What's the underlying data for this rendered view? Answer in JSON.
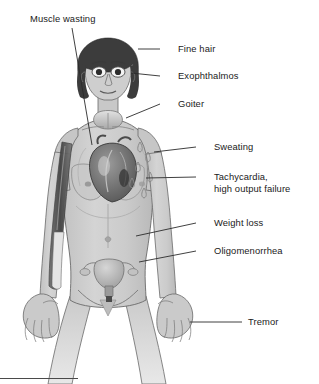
{
  "figure": {
    "background_color": "#ffffff",
    "body_fill": "#cfcfcf",
    "body_shade": "#b8b8b8",
    "outline_color": "#555555",
    "hair_color": "#3c3c3c",
    "organ_dark": "#5a5a5a",
    "organ_mid": "#8e8e8e",
    "organ_light": "#bdbdbd",
    "text_color": "#1a1a1a",
    "leader_color": "#2b2b2b"
  },
  "labels": [
    {
      "id": "muscle-wasting",
      "text": "Muscle wasting",
      "x": 30,
      "y": 13,
      "side": "left",
      "target": "upper arm muscle cutaway",
      "leader": {
        "x1": 72,
        "y1": 28,
        "x2": 92,
        "y2": 145
      }
    },
    {
      "id": "fine-hair",
      "text": "Fine hair",
      "x": 178,
      "y": 44,
      "side": "right",
      "target": "scalp hair",
      "leader": {
        "x1": 160,
        "y1": 49,
        "x2": 138,
        "y2": 49
      }
    },
    {
      "id": "exophthalmos",
      "text": "Exophthalmos",
      "x": 178,
      "y": 71,
      "side": "right",
      "target": "protruding eyes",
      "leader": {
        "x1": 160,
        "y1": 76,
        "x2": 131,
        "y2": 73
      }
    },
    {
      "id": "goiter",
      "text": "Goiter",
      "x": 178,
      "y": 99,
      "side": "right",
      "target": "enlarged thyroid gland at neck",
      "leader": {
        "x1": 160,
        "y1": 104,
        "x2": 126,
        "y2": 118
      }
    },
    {
      "id": "sweating",
      "text": "Sweating",
      "x": 214,
      "y": 142,
      "side": "right",
      "target": "sweat droplets on chest",
      "leader": {
        "x1": 196,
        "y1": 147,
        "x2": 156,
        "y2": 152
      }
    },
    {
      "id": "tachycardia",
      "text": "Tachycardia,\nhigh output failure",
      "line1": "Tachycardia,",
      "line2": "high output failure",
      "x": 214,
      "y": 172,
      "side": "right",
      "target": "heart",
      "leader": {
        "x1": 196,
        "y1": 177,
        "x2": 148,
        "y2": 178
      }
    },
    {
      "id": "weight-loss",
      "text": "Weight loss",
      "x": 214,
      "y": 218,
      "side": "right",
      "target": "abdomen / thin torso",
      "leader": {
        "x1": 196,
        "y1": 223,
        "x2": 136,
        "y2": 236
      }
    },
    {
      "id": "oligomenorrhea",
      "text": "Oligomenorrhea",
      "x": 214,
      "y": 246,
      "side": "right",
      "target": "uterus and ovaries",
      "leader": {
        "x1": 196,
        "y1": 251,
        "x2": 139,
        "y2": 262
      }
    },
    {
      "id": "tremor",
      "text": "Tremor",
      "x": 248,
      "y": 317,
      "side": "right",
      "target": "right hand",
      "leader": {
        "x1": 242,
        "y1": 322,
        "x2": 190,
        "y2": 322
      }
    }
  ],
  "anatomy": {
    "parts": [
      "head",
      "hair",
      "eyes",
      "nose",
      "mouth",
      "neck",
      "goiter",
      "shoulders",
      "arms",
      "hands",
      "breasts",
      "heart",
      "sweat-droplets",
      "muscle-cutaway",
      "abdomen",
      "uterus",
      "ovaries",
      "pelvis",
      "legs"
    ]
  },
  "footer_rule": {
    "x": 0,
    "y": 378,
    "width": 78
  }
}
